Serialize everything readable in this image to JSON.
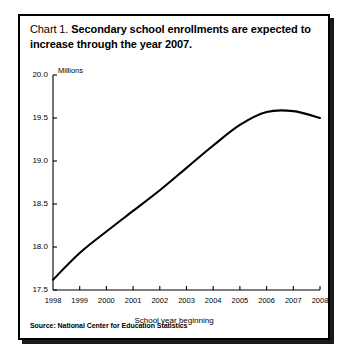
{
  "figure": {
    "title_prefix": "Chart 1.",
    "title_main": "Secondary school enrollments are expected to increase through the year 2007.",
    "source_note": "Source: National Center for Education Statistics"
  },
  "chart_data": {
    "type": "line",
    "title": "Chart 1.  Secondary school enrollments are expected to increase through the year 2007.",
    "xlabel": "School year beginning",
    "ylabel": "Millions",
    "unit_label": "Millions",
    "x": [
      1998,
      1999,
      2000,
      2001,
      2002,
      2003,
      2004,
      2005,
      2006,
      2007,
      2008
    ],
    "values": [
      17.62,
      17.93,
      18.18,
      18.42,
      18.66,
      18.92,
      19.18,
      19.42,
      19.57,
      19.58,
      19.5
    ],
    "series": [
      {
        "name": "Secondary school enrollments",
        "values": [
          17.62,
          17.93,
          18.18,
          18.42,
          18.66,
          18.92,
          19.18,
          19.42,
          19.57,
          19.58,
          19.5
        ]
      }
    ],
    "categories": [
      "1998",
      "1999",
      "2000",
      "2001",
      "2002",
      "2003",
      "2004",
      "2005",
      "2006",
      "2007",
      "2008"
    ],
    "xtick_labels": [
      "1998",
      "1999",
      "2000",
      "2001",
      "2002",
      "2003",
      "2004",
      "2005",
      "2006",
      "2007",
      "2008"
    ],
    "ytick_labels": [
      "20.0",
      "19.5",
      "19.0",
      "18.5",
      "18.0",
      "17.5"
    ],
    "ytick_values": [
      20.0,
      19.5,
      19.0,
      18.5,
      18.0,
      17.5
    ],
    "ylim": [
      17.5,
      20.0
    ],
    "xlim": [
      1998,
      2008
    ],
    "grid": false,
    "legend": false,
    "line_color": "#000000",
    "background_color": "#ffffff"
  }
}
